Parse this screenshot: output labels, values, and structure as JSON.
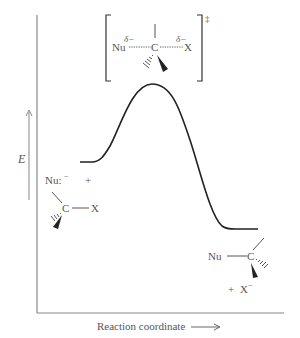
{
  "diagram": {
    "type": "reaction-energy-profile",
    "y_axis_label": "E",
    "x_axis_label": "Reaction coordinate",
    "colors": {
      "curve": "#222222",
      "axis": "#777777",
      "text": "#555555"
    },
    "transition_state": {
      "nucleophile": "Nu",
      "nu_charge": "δ−",
      "center": "C",
      "leaving_group": "X",
      "lg_charge": "δ−",
      "double_dagger": "‡"
    },
    "reactants": {
      "nucleophile": "Nu:",
      "nu_charge": "−",
      "plus": "+",
      "center": "C",
      "leaving_group": "X"
    },
    "products": {
      "nucleophile": "Nu",
      "center": "C",
      "plus": "+",
      "leaving_group": "X",
      "lg_charge": "−"
    }
  }
}
